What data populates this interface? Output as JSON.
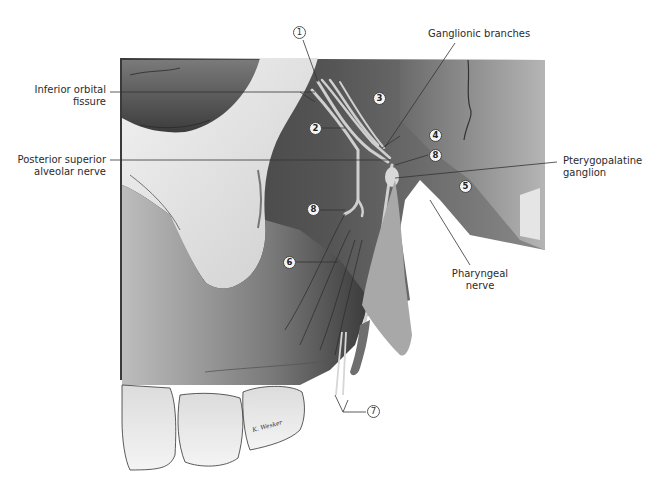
{
  "figure": {
    "palette": {
      "background": "#ffffff",
      "bone_light": "#e8e8e8",
      "bone_mid": "#9a9a9a",
      "shadow_dark": "#2a2a2a",
      "nerve": "#c8c8c8",
      "label_text": "#2b2b2b",
      "leader_line": "#333333"
    }
  },
  "labels": {
    "inferior_orbital_fissure": "Inferior orbital\nfissure",
    "inferior_orbital_fissure_l1": "Inferior orbital",
    "inferior_orbital_fissure_l2": "fissure",
    "posterior_superior_alveolar_l1": "Posterior superior",
    "posterior_superior_alveolar_l2": "alveolar nerve",
    "ganglionic_branches": "Ganglionic branches",
    "pterygopalatine_l1": "Pterygopalatine",
    "pterygopalatine_l2": "ganglion",
    "pharyngeal_l1": "Pharyngeal",
    "pharyngeal_l2": "nerve"
  },
  "markers": [
    {
      "id": "1",
      "style": "outline"
    },
    {
      "id": "2",
      "style": "filled"
    },
    {
      "id": "3",
      "style": "filled"
    },
    {
      "id": "4",
      "style": "filled"
    },
    {
      "id": "8",
      "style": "filled"
    },
    {
      "id": "5",
      "style": "filled"
    },
    {
      "id": "8",
      "style": "filled"
    },
    {
      "id": "6",
      "style": "filled"
    },
    {
      "id": "7",
      "style": "outline"
    }
  ],
  "signature": "K. Wesker"
}
